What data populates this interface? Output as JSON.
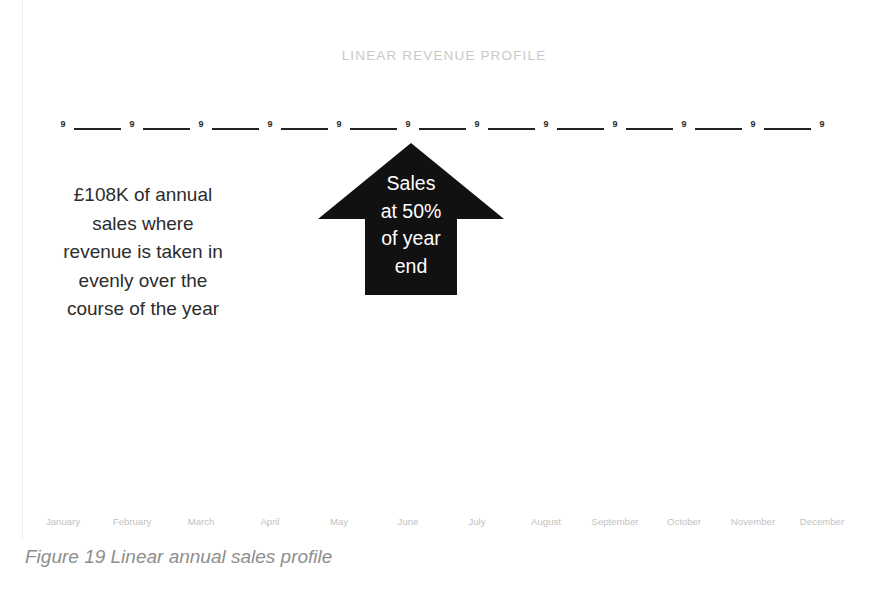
{
  "figure": {
    "caption": "Figure 19 Linear annual sales profile"
  },
  "chart_data": {
    "type": "line",
    "title": "LINEAR REVENUE PROFILE",
    "xlabel": "",
    "ylabel": "",
    "grid": false,
    "legend": "none",
    "categories": [
      "January",
      "February",
      "March",
      "April",
      "May",
      "June",
      "July",
      "August",
      "September",
      "October",
      "November",
      "December"
    ],
    "values": [
      9,
      9,
      9,
      9,
      9,
      9,
      9,
      9,
      9,
      9,
      9,
      9
    ],
    "data_labels": [
      "9",
      "9",
      "9",
      "9",
      "9",
      "9",
      "9",
      "9",
      "9",
      "9",
      "9",
      "9"
    ],
    "series": [
      {
        "name": "Monthly revenue",
        "values": [
          9,
          9,
          9,
          9,
          9,
          9,
          9,
          9,
          9,
          9,
          9,
          9
        ]
      }
    ],
    "ylim": [
      0,
      18
    ],
    "annotations": [
      {
        "name": "left-note",
        "lines": [
          "£108K of annual",
          "sales where",
          "revenue is taken in",
          "evenly over the",
          "course of the year"
        ]
      },
      {
        "name": "arrow-callout",
        "lines": [
          "Sales",
          "at 50%",
          "of year",
          "end"
        ]
      }
    ]
  },
  "colors": {
    "background": "#ffffff",
    "series_line": "#232323",
    "data_label": "#2a2a2a",
    "title": "#c9c9c9",
    "axis_label": "#c2c2c2",
    "annotation_text": "#2c2c2c",
    "callout_fill": "#111111",
    "callout_text": "#ffffff",
    "caption": "#8e8e8e"
  }
}
